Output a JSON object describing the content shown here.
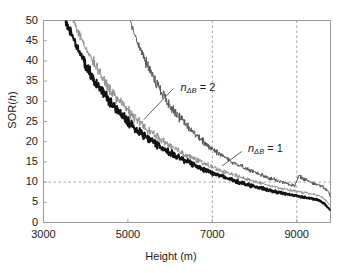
{
  "chart_data": {
    "type": "line",
    "title": "",
    "xlabel": "Height (m)",
    "ylabel": "SOR(h)",
    "xlim": [
      3000,
      9800
    ],
    "ylim": [
      0,
      50
    ],
    "xticks": [
      3000,
      5000,
      7000,
      9000
    ],
    "xtick_labels": [
      "3000",
      "5000",
      "7000",
      "9000"
    ],
    "yticks": [
      0,
      5,
      10,
      15,
      20,
      25,
      30,
      35,
      40,
      45,
      50
    ],
    "ytick_labels": [
      "0",
      "5",
      "10",
      "15",
      "20",
      "25",
      "30",
      "35",
      "40",
      "45",
      "50"
    ],
    "grid": false,
    "legend": "none",
    "reference_lines": [
      {
        "name": "sor-threshold",
        "orient": "horizontal",
        "value": 10,
        "style": "dashed"
      },
      {
        "name": "height-7000",
        "orient": "vertical",
        "value": 7000,
        "style": "dashed"
      },
      {
        "name": "height-9000",
        "orient": "vertical",
        "value": 9000,
        "style": "dashed"
      }
    ],
    "annotations": [
      {
        "name": "annotation-ndb-2",
        "text_base": "n",
        "text_sub": "ΔB",
        "text_eq": " = 2",
        "x": 6150,
        "y": 33
      },
      {
        "name": "annotation-ndb-1",
        "text_base": "n",
        "text_sub": "ΔB",
        "text_eq": " = 1",
        "x": 7750,
        "y": 18
      }
    ],
    "series": [
      {
        "name": "n_dB = 0 (thick black)",
        "color": "#121212",
        "width": 2.0,
        "x": [
          3520,
          3600,
          3700,
          3800,
          3900,
          4000,
          4100,
          4200,
          4300,
          4400,
          4500,
          4600,
          4700,
          4800,
          4900,
          5000,
          5100,
          5200,
          5300,
          5400,
          5500,
          5600,
          5700,
          5800,
          5900,
          6000,
          6100,
          6200,
          6300,
          6400,
          6500,
          6600,
          6700,
          6800,
          6900,
          7000,
          7100,
          7200,
          7300,
          7400,
          7500,
          7600,
          7700,
          7800,
          7900,
          8000,
          8100,
          8200,
          8300,
          8400,
          8500,
          8600,
          8700,
          8800,
          8900,
          9000,
          9100,
          9200,
          9300,
          9400,
          9500,
          9600,
          9700,
          9800
        ],
        "y": [
          50.0,
          48.2,
          45.7,
          43.4,
          41.3,
          39.2,
          37.3,
          35.6,
          34.0,
          32.4,
          30.9,
          29.6,
          28.3,
          27.1,
          26.0,
          25.0,
          24.0,
          23.1,
          22.2,
          21.4,
          20.6,
          19.9,
          19.2,
          18.5,
          17.9,
          17.3,
          16.7,
          16.1,
          15.6,
          15.1,
          14.6,
          14.1,
          13.6,
          13.2,
          12.8,
          12.3,
          11.9,
          11.5,
          11.1,
          10.8,
          10.4,
          10.1,
          9.8,
          9.5,
          9.2,
          8.9,
          8.6,
          8.4,
          8.1,
          7.9,
          7.6,
          7.4,
          7.2,
          7.0,
          6.8,
          6.6,
          6.4,
          6.2,
          6.0,
          5.8,
          5.6,
          5.0,
          4.2,
          3.0
        ]
      },
      {
        "name": "n_dB = 1 (thin gray)",
        "color": "#8c8c8c",
        "width": 0.9,
        "x": [
          3700,
          3800,
          3900,
          4000,
          4100,
          4200,
          4300,
          4400,
          4500,
          4600,
          4700,
          4800,
          4900,
          5000,
          5100,
          5200,
          5300,
          5400,
          5500,
          5600,
          5700,
          5800,
          5900,
          6000,
          6100,
          6200,
          6300,
          6400,
          6500,
          6600,
          6700,
          6800,
          6900,
          7000,
          7100,
          7200,
          7300,
          7400,
          7500,
          7600,
          7700,
          7800,
          7900,
          8000,
          8100,
          8200,
          8300,
          8400,
          8500,
          8600,
          8700,
          8800,
          8900,
          9000,
          9100,
          9200,
          9300,
          9400,
          9500,
          9600,
          9700,
          9800
        ],
        "y": [
          50.0,
          47.8,
          45.4,
          43.2,
          41.2,
          39.3,
          37.5,
          35.8,
          34.2,
          32.8,
          31.4,
          30.1,
          28.9,
          27.7,
          26.6,
          25.6,
          24.6,
          23.7,
          22.8,
          22.0,
          21.2,
          20.4,
          19.7,
          19.0,
          18.4,
          17.8,
          17.2,
          16.6,
          16.1,
          15.6,
          15.1,
          14.6,
          14.2,
          13.7,
          13.3,
          12.9,
          12.5,
          12.1,
          11.8,
          11.4,
          11.1,
          10.8,
          10.5,
          10.2,
          9.9,
          9.6,
          9.3,
          9.1,
          8.8,
          8.6,
          8.3,
          8.1,
          7.9,
          7.7,
          7.5,
          7.3,
          7.1,
          6.9,
          6.7,
          6.2,
          5.4,
          4.1
        ]
      },
      {
        "name": "n_dB = 2 (thin dark, right)",
        "color": "#4d4d4d",
        "width": 0.9,
        "x": [
          5050,
          5150,
          5250,
          5350,
          5450,
          5550,
          5650,
          5750,
          5850,
          5950,
          6050,
          6150,
          6250,
          6350,
          6450,
          6550,
          6650,
          6750,
          6850,
          6950,
          7050,
          7150,
          7250,
          7350,
          7450,
          7550,
          7650,
          7750,
          7850,
          7950,
          8050,
          8150,
          8250,
          8350,
          8450,
          8550,
          8650,
          8750,
          8850,
          8950,
          9050,
          9150,
          9250,
          9350,
          9450,
          9550,
          9650,
          9750,
          9800
        ],
        "y": [
          50.0,
          47.0,
          44.2,
          41.6,
          39.3,
          37.1,
          35.1,
          33.2,
          31.5,
          29.9,
          28.4,
          27.0,
          25.7,
          24.5,
          23.4,
          22.3,
          21.3,
          20.4,
          19.5,
          18.7,
          17.9,
          17.2,
          16.5,
          15.8,
          15.2,
          14.6,
          14.1,
          13.6,
          13.1,
          12.6,
          12.2,
          11.8,
          11.4,
          11.0,
          10.7,
          10.3,
          10.0,
          9.7,
          9.4,
          9.1,
          11.5,
          10.9,
          10.4,
          10.0,
          9.6,
          9.2,
          8.6,
          7.6,
          6.4
        ]
      }
    ]
  },
  "axes": {
    "frame_color": "#9a9a9a",
    "dash_color": "#9a9a9a"
  }
}
